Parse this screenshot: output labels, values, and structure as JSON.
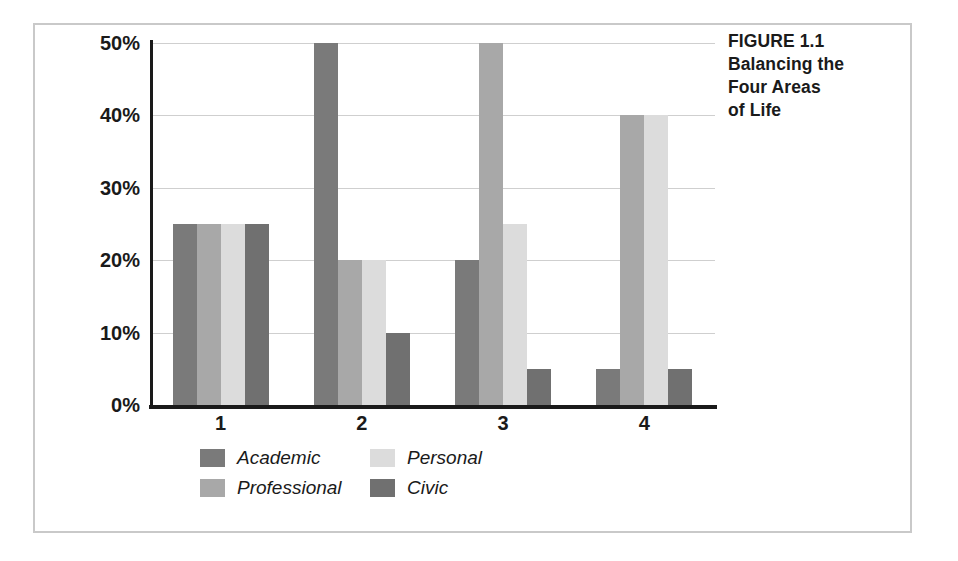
{
  "caption": {
    "lines": [
      "FIGURE 1.1",
      "Balancing the",
      "Four Areas",
      "of Life"
    ]
  },
  "frame": {
    "border_color": "#c9c9c9"
  },
  "axis": {
    "y_ticks": [
      "0%",
      "10%",
      "20%",
      "30%",
      "40%",
      "50%"
    ],
    "x_ticks": [
      "1",
      "2",
      "3",
      "4"
    ]
  },
  "legend": {
    "items": [
      {
        "label": "Academic",
        "color": "#7a7a7a"
      },
      {
        "label": "Personal",
        "color": "#dcdcdc"
      },
      {
        "label": "Professional",
        "color": "#a8a8a8"
      },
      {
        "label": "Civic",
        "color": "#707070"
      }
    ]
  },
  "chart_data": {
    "type": "bar",
    "title": "Balancing the Four Areas of Life",
    "xlabel": "",
    "ylabel": "",
    "categories": [
      "1",
      "2",
      "3",
      "4"
    ],
    "ylim": [
      0,
      50
    ],
    "y_tick_values": [
      0,
      10,
      20,
      30,
      40,
      50
    ],
    "y_tick_labels": [
      "0%",
      "10%",
      "20%",
      "30%",
      "40%",
      "50%"
    ],
    "grid": true,
    "legend_position": "bottom",
    "value_unit": "percent",
    "series": [
      {
        "name": "Academic",
        "color": "#7a7a7a",
        "values": [
          25,
          50,
          20,
          5
        ]
      },
      {
        "name": "Professional",
        "color": "#a8a8a8",
        "values": [
          25,
          20,
          50,
          40
        ]
      },
      {
        "name": "Personal",
        "color": "#dcdcdc",
        "values": [
          25,
          20,
          25,
          40
        ]
      },
      {
        "name": "Civic",
        "color": "#707070",
        "values": [
          25,
          10,
          5,
          5
        ]
      }
    ]
  }
}
